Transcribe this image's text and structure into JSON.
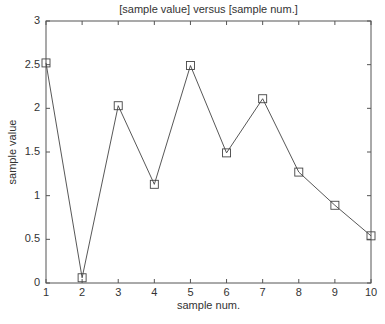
{
  "chart_data": {
    "type": "line",
    "title": "[sample value] versus [sample num.]",
    "xlabel": "sample num.",
    "ylabel": "sample value",
    "x": [
      1,
      2,
      3,
      4,
      5,
      6,
      7,
      8,
      9,
      10
    ],
    "series": [
      {
        "name": "sample value",
        "values": [
          2.52,
          0.06,
          2.03,
          1.13,
          2.49,
          1.49,
          2.11,
          1.27,
          0.89,
          0.54
        ],
        "marker": "square",
        "color": "#444444"
      }
    ],
    "xlim": [
      1,
      10
    ],
    "ylim": [
      0,
      3
    ],
    "xticks": [
      1,
      2,
      3,
      4,
      5,
      6,
      7,
      8,
      9,
      10
    ],
    "yticks": [
      0,
      0.5,
      1,
      1.5,
      2,
      2.5,
      3
    ],
    "ytick_labels": [
      "0",
      "0.5",
      "1",
      "1.5",
      "2",
      "2.5",
      "3"
    ],
    "grid": false,
    "legend": false
  }
}
